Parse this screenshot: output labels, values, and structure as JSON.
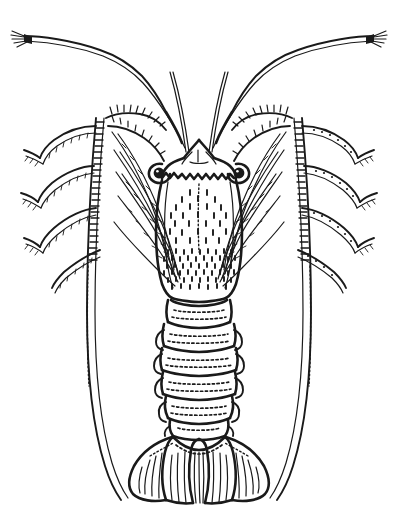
{
  "figure": {
    "view": "dorsal",
    "style": "scientific ink line drawing",
    "background_color": "#ffffff",
    "ink_color": "#1a1a1a",
    "caption": "",
    "width": 398,
    "height": 530
  },
  "anatomy": {
    "parts": [
      {
        "id": "antenna-left",
        "label": "Left antennal flagellum"
      },
      {
        "id": "antenna-right",
        "label": "Right antennal flagellum"
      },
      {
        "id": "antennule-left",
        "label": "Left antennule"
      },
      {
        "id": "antennule-right",
        "label": "Right antennule"
      },
      {
        "id": "eye-left",
        "label": "Left eye"
      },
      {
        "id": "eye-right",
        "label": "Right eye"
      },
      {
        "id": "rostrum",
        "label": "Rostrum and frontal horns"
      },
      {
        "id": "carapace",
        "label": "Carapace"
      },
      {
        "id": "abdomen",
        "label": "Abdomen"
      },
      {
        "id": "tail-fan",
        "label": "Tail fan"
      },
      {
        "id": "telson",
        "label": "Telson"
      },
      {
        "id": "legs-left",
        "label": "Left walking legs"
      },
      {
        "id": "legs-right",
        "label": "Right walking legs"
      }
    ],
    "counts": {
      "abdominal_segments": 6,
      "walking_legs_per_side": 5,
      "tail_fan_lobes": 5,
      "antennae": 2
    }
  }
}
